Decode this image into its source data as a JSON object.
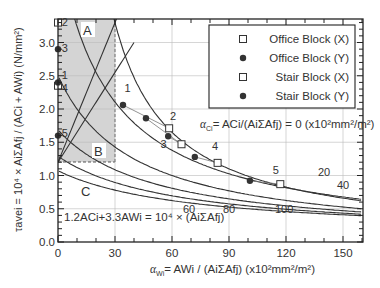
{
  "chart_data": {
    "type": "line",
    "title": "",
    "xlabel": "αWi = AWi / (Ai ΣAfj) (x10² mm²/m²)",
    "ylabel": "τavei = 10⁴ × Ai ΣAfj / (ACi + AWi) (N/mm²)",
    "xlim": [
      0,
      160
    ],
    "ylim": [
      0.0,
      3.3
    ],
    "x_ticks": [
      "0",
      "30",
      "60",
      "90",
      "120",
      "150"
    ],
    "y_ticks": [
      "0.0",
      "0.5",
      "1.0",
      "1.5",
      "2.0",
      "2.5",
      "3.0"
    ],
    "grid": true,
    "legend_position": "upper right",
    "curve_family_label": "αCi = ACi/(Ai ΣAfj) = 0 (x10² mm²/m²)",
    "equation_label": "1.2ACi + 3.3AWi = 10⁴ × (Ai ΣAfj)",
    "regions": [
      {
        "label": "A",
        "x_range": [
          0,
          30
        ],
        "y_range": [
          1.2,
          3.3
        ]
      },
      {
        "label": "B",
        "x_range": [
          0,
          30
        ],
        "y_range": [
          1.2,
          3.3
        ]
      },
      {
        "label": "C",
        "note": "below 1.2 N/mm²"
      }
    ],
    "curve_labels": [
      {
        "label": "0",
        "x": 95,
        "y": 1.65
      },
      {
        "label": "20",
        "x": 140,
        "y": 1.0
      },
      {
        "label": "40",
        "x": 150,
        "y": 0.8
      },
      {
        "label": "60",
        "x": 69,
        "y": 0.44
      },
      {
        "label": "80",
        "x": 90,
        "y": 0.44
      },
      {
        "label": "100",
        "x": 119,
        "y": 0.44
      }
    ],
    "series": [
      {
        "name": "Office Block (X)",
        "marker": "open-square",
        "points": [
          [
            58.5,
            1.71
          ],
          [
            65.0,
            1.47
          ],
          [
            84.0,
            1.19
          ],
          [
            117.0,
            0.87
          ]
        ]
      },
      {
        "name": "Office Block (Y)",
        "marker": "filled-circle",
        "points": [
          [
            34.2,
            2.06
          ],
          [
            46.3,
            1.86
          ],
          [
            58.0,
            1.59
          ],
          [
            72.0,
            1.28
          ],
          [
            101.0,
            0.92
          ]
        ]
      },
      {
        "name": "Stair Block (X)",
        "marker": "open-square",
        "points": [
          [
            0,
            3.3
          ],
          [
            0,
            2.35
          ]
        ]
      },
      {
        "name": "Stair Block (Y)",
        "marker": "filled-circle",
        "points": [
          [
            0,
            2.9
          ],
          [
            0,
            2.4
          ],
          [
            0,
            1.6
          ]
        ]
      }
    ],
    "point_labels": [
      {
        "label": "1",
        "x": 35,
        "y": 2.25
      },
      {
        "label": "2",
        "x": 59,
        "y": 1.83
      },
      {
        "label": "3",
        "x": 54,
        "y": 1.42
      },
      {
        "label": "4",
        "x": 81,
        "y": 1.38
      },
      {
        "label": "5",
        "x": 113,
        "y": 1.03
      },
      {
        "label": "2",
        "x": 2,
        "y": 3.25
      },
      {
        "label": "3",
        "x": 2,
        "y": 2.85
      },
      {
        "label": "1",
        "x": 2,
        "y": 2.45
      },
      {
        "label": "4",
        "x": 2,
        "y": 2.25
      },
      {
        "label": "5",
        "x": 2,
        "y": 1.58
      }
    ]
  },
  "legend": {
    "items": [
      {
        "label": "Office Block (X)",
        "marker": "open-square"
      },
      {
        "label": "Office Block (Y)",
        "marker": "filled-circle"
      },
      {
        "label": "Stair Block (X)",
        "marker": "open-square"
      },
      {
        "label": "Stair Block (Y)",
        "marker": "filled-circle"
      }
    ]
  },
  "axis": {
    "x_ticks": [
      "0",
      "30",
      "60",
      "90",
      "120",
      "150"
    ],
    "y_ticks": [
      "0.0",
      "0.5",
      "1.0",
      "1.5",
      "2.0",
      "2.5",
      "3.0"
    ]
  },
  "regions": {
    "a": "A",
    "b": "B",
    "c": "C"
  },
  "labels": {
    "curve_family": "= ACi/(AiΣAfj) = 0 (x10²mm²/m²)",
    "equation": "1.2ACi+3.3AWi = 10⁴ × (AiΣAfj)",
    "xlabel": "= AWi / (AiΣAfj) (x10²mm²/m²)",
    "ylabel": "τavei = 10⁴ × AiΣAfj / (ACi + AWi) (N/mm²)"
  }
}
